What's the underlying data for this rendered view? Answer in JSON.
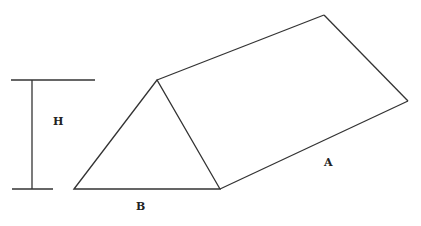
{
  "diagram": {
    "labels": {
      "height": "H",
      "base": "B",
      "length": "A"
    },
    "stroke_color": "#333333"
  }
}
